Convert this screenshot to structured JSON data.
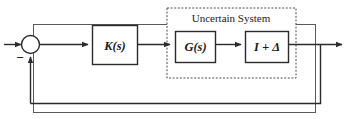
{
  "figure": {
    "type": "control-block-diagram",
    "background_color": "#ffffff",
    "line_color": "#2b2b2b",
    "border": {
      "present": true,
      "style": "solid"
    },
    "summing_junction": {
      "shape": "circle",
      "feedback_sign": "−",
      "reference_input_arrow": true,
      "feedback_input_arrow": true
    },
    "blocks": [
      {
        "name": "controller",
        "label": "K(s)"
      },
      {
        "name": "plant",
        "label": "G(s)"
      },
      {
        "name": "uncertainty",
        "label": "I + Δ"
      }
    ],
    "group_box": {
      "label": "Uncertain System",
      "style": "dashed",
      "contains": [
        "G(s)",
        "I + Δ"
      ]
    },
    "signal_flow": {
      "forward_path": [
        "reference",
        "summing-junction",
        "K(s)",
        "G(s)",
        "I + Δ",
        "output"
      ],
      "feedback_path": [
        "output",
        "summing-junction"
      ]
    }
  }
}
